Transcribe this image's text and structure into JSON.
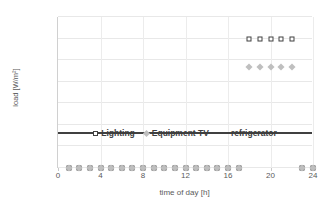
{
  "chart_data": {
    "type": "scatter",
    "title": "",
    "xlabel": "time of day [h]",
    "ylabel": "load [W/m²]",
    "xlim": [
      0,
      24
    ],
    "ylim": [
      0,
      14
    ],
    "xticks": [
      0,
      4,
      8,
      12,
      16,
      20,
      24
    ],
    "yticks": [
      0.0,
      2.0,
      4.0,
      6.0,
      8.0,
      10.0,
      12.0,
      14.0
    ],
    "ytick_labels": [
      "0.0",
      "2.0",
      "4.0",
      "6.0",
      "8.0",
      "10.0",
      "12.0",
      "14.0"
    ],
    "xtick_labels": [
      "0",
      "4",
      "8",
      "12",
      "16",
      "20",
      "24"
    ],
    "grid": true,
    "legend_position": "inside-center",
    "x": [
      1,
      2,
      3,
      4,
      5,
      6,
      7,
      8,
      9,
      10,
      11,
      12,
      13,
      14,
      15,
      16,
      17,
      18,
      19,
      20,
      21,
      22,
      23,
      24
    ],
    "series": [
      {
        "name": "Lighting",
        "marker": "open-square",
        "color": "#404040",
        "values": [
          0.0,
          0.0,
          0.0,
          0.0,
          0.0,
          0.0,
          0.0,
          0.0,
          0.0,
          0.0,
          0.0,
          0.0,
          0.0,
          0.0,
          0.0,
          0.0,
          0.0,
          12.0,
          12.0,
          12.0,
          12.0,
          12.0,
          0.0,
          0.0
        ]
      },
      {
        "name": "Equipment TV",
        "marker": "filled-diamond",
        "color": "#bfbfbf",
        "values": [
          0.0,
          0.0,
          0.0,
          0.0,
          0.0,
          0.0,
          0.0,
          0.0,
          0.0,
          0.0,
          0.0,
          0.0,
          0.0,
          0.0,
          0.0,
          0.0,
          0.0,
          9.4,
          9.4,
          9.4,
          9.4,
          9.4,
          0.0,
          0.0
        ]
      },
      {
        "name": "refrigerator",
        "marker": "line",
        "color": "#404040",
        "values": [
          3.2,
          3.2,
          3.2,
          3.2,
          3.2,
          3.2,
          3.2,
          3.2,
          3.2,
          3.2,
          3.2,
          3.2,
          3.2,
          3.2,
          3.2,
          3.2,
          3.2,
          3.2,
          3.2,
          3.2,
          3.2,
          3.2,
          3.2,
          3.2
        ]
      }
    ],
    "legend": [
      "Lighting",
      "Equipment TV",
      "refrigerator"
    ],
    "legend_y_value": 2.3
  }
}
